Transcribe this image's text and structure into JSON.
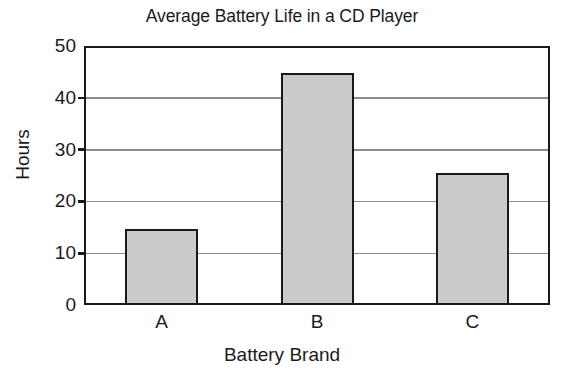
{
  "chart_data": {
    "type": "bar",
    "title": "Average Battery Life in a CD Player",
    "xlabel": "Battery Brand",
    "ylabel": "Hours",
    "categories": [
      "A",
      "B",
      "C"
    ],
    "values": [
      14.7,
      44.8,
      25.5
    ],
    "ylim": [
      0,
      50
    ],
    "yticks": [
      0,
      10,
      20,
      30,
      40,
      50
    ],
    "ytick_labels": [
      "0",
      "10",
      "20",
      "30",
      "40",
      "50"
    ],
    "grid": true,
    "legend": null,
    "bar_fill_color": "#cbcbcb",
    "bar_edge_color": "#1a1a1a",
    "gridline_color": "#8c8c8c",
    "background_color": "#ffffff"
  }
}
